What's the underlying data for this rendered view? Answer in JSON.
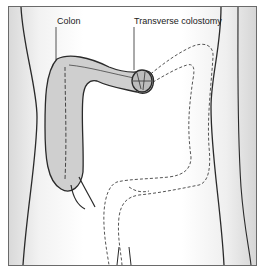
{
  "figure": {
    "labels": {
      "colon": "Colon",
      "transverse_colostomy": "Transverse colostomy"
    },
    "colors": {
      "outline": "#2a2a2a",
      "colon_fill": "#cfcfcf",
      "background_shade": "#d9d9d9"
    }
  }
}
